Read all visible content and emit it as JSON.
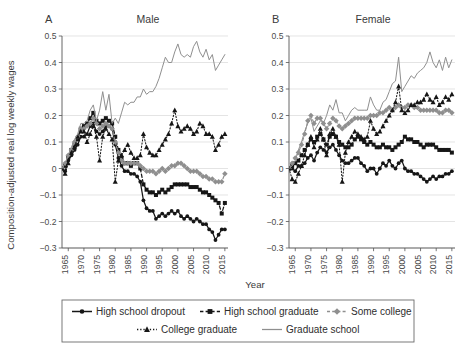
{
  "figure": {
    "ylabel": "Composition-adjusted real log weekly wages",
    "xlabel": "Year",
    "panels": [
      {
        "letter": "A",
        "title": "Male"
      },
      {
        "letter": "B",
        "title": "Female"
      }
    ],
    "legend": {
      "items": [
        {
          "label": "High school dropout",
          "style": "solid",
          "marker": "circle",
          "color": "#1a1a1a"
        },
        {
          "label": "High school graduate",
          "style": "dashed",
          "marker": "square",
          "color": "#1a1a1a"
        },
        {
          "label": "Some college",
          "style": "dashed",
          "marker": "diamond",
          "color": "#8c8c8c"
        },
        {
          "label": "College graduate",
          "style": "dotted",
          "marker": "triangle",
          "color": "#1a1a1a"
        },
        {
          "label": "Graduate school",
          "style": "solid",
          "marker": "none",
          "color": "#8c8c8c"
        }
      ]
    }
  },
  "chart_data": [
    {
      "type": "line",
      "title": "Male",
      "panel": "A",
      "xlabel": "Year",
      "ylabel": "Composition-adjusted real log weekly wages",
      "xlim": [
        1963,
        2016
      ],
      "ylim": [
        -0.3,
        0.5
      ],
      "yticks": [
        -0.3,
        -0.2,
        -0.1,
        0,
        0.1,
        0.2,
        0.3,
        0.4,
        0.5
      ],
      "ytick_labels": [
        "−0.3",
        "−0.2",
        "−0.1",
        "0",
        "0.1",
        "0.2",
        "0.3",
        "0.4",
        "0.5"
      ],
      "xticks": [
        1965,
        1970,
        1975,
        1980,
        1985,
        1990,
        1995,
        2000,
        2005,
        2010,
        2015
      ],
      "xtick_labels": [
        "1965",
        "1970",
        "1975",
        "1980",
        "1985",
        "1990",
        "1995",
        "2000",
        "2005",
        "2010",
        "2015"
      ],
      "grid": true,
      "legend_position": "bottom",
      "x": [
        1963,
        1964,
        1965,
        1966,
        1967,
        1968,
        1969,
        1970,
        1971,
        1972,
        1973,
        1974,
        1975,
        1976,
        1977,
        1978,
        1979,
        1980,
        1981,
        1982,
        1983,
        1984,
        1985,
        1986,
        1987,
        1988,
        1989,
        1990,
        1991,
        1992,
        1993,
        1994,
        1995,
        1996,
        1997,
        1998,
        1999,
        2000,
        2001,
        2002,
        2003,
        2004,
        2005,
        2006,
        2007,
        2008,
        2009,
        2010,
        2011,
        2012,
        2013,
        2014,
        2015
      ],
      "series": [
        {
          "name": "High school dropout",
          "values": [
            0.0,
            -0.01,
            0.03,
            0.05,
            0.07,
            0.09,
            0.12,
            0.12,
            0.13,
            0.16,
            0.17,
            0.14,
            0.13,
            0.14,
            0.16,
            0.16,
            0.15,
            0.09,
            0.04,
            0.01,
            -0.01,
            -0.01,
            -0.02,
            -0.02,
            -0.03,
            -0.05,
            -0.12,
            -0.15,
            -0.16,
            -0.16,
            -0.19,
            -0.18,
            -0.17,
            -0.18,
            -0.17,
            -0.16,
            -0.17,
            -0.16,
            -0.18,
            -0.19,
            -0.18,
            -0.19,
            -0.2,
            -0.19,
            -0.2,
            -0.21,
            -0.21,
            -0.23,
            -0.24,
            -0.27,
            -0.25,
            -0.23,
            -0.23
          ]
        },
        {
          "name": "High school graduate",
          "values": [
            0.0,
            0.01,
            0.04,
            0.07,
            0.09,
            0.11,
            0.15,
            0.16,
            0.17,
            0.19,
            0.21,
            0.18,
            0.17,
            0.18,
            0.19,
            0.18,
            0.17,
            0.12,
            0.07,
            0.04,
            0.02,
            0.02,
            0.01,
            0.02,
            0.02,
            0.0,
            -0.06,
            -0.08,
            -0.09,
            -0.09,
            -0.1,
            -0.09,
            -0.08,
            -0.09,
            -0.08,
            -0.07,
            -0.06,
            -0.06,
            -0.06,
            -0.06,
            -0.06,
            -0.07,
            -0.07,
            -0.07,
            -0.08,
            -0.09,
            -0.09,
            -0.1,
            -0.11,
            -0.12,
            -0.13,
            -0.17,
            -0.13
          ]
        },
        {
          "name": "Some college",
          "values": [
            0.0,
            0.02,
            0.05,
            0.07,
            0.1,
            0.12,
            0.15,
            0.15,
            0.16,
            0.17,
            0.19,
            0.17,
            0.15,
            0.16,
            0.17,
            0.16,
            0.15,
            0.1,
            0.06,
            0.03,
            0.02,
            0.02,
            0.02,
            0.02,
            0.02,
            0.01,
            0.0,
            -0.01,
            -0.01,
            -0.01,
            -0.02,
            -0.01,
            0.0,
            -0.01,
            0.0,
            0.01,
            0.01,
            0.02,
            0.02,
            0.01,
            0.0,
            -0.01,
            -0.01,
            -0.01,
            -0.02,
            -0.03,
            -0.03,
            -0.04,
            -0.04,
            -0.05,
            -0.05,
            -0.05,
            -0.02
          ]
        },
        {
          "name": "College graduate",
          "values": [
            0.0,
            -0.02,
            0.02,
            0.06,
            0.08,
            0.12,
            0.14,
            0.14,
            0.1,
            0.13,
            0.16,
            0.12,
            0.03,
            0.12,
            0.15,
            0.13,
            0.11,
            -0.05,
            0.03,
            0.05,
            0.07,
            0.09,
            0.06,
            0.04,
            0.04,
            0.05,
            0.13,
            0.08,
            0.06,
            0.05,
            0.05,
            0.07,
            0.09,
            0.11,
            0.13,
            0.17,
            0.22,
            0.16,
            0.14,
            0.15,
            0.16,
            0.15,
            0.13,
            0.14,
            0.17,
            0.16,
            0.13,
            0.13,
            0.12,
            0.07,
            0.09,
            0.12,
            0.13
          ]
        },
        {
          "name": "Graduate school",
          "values": [
            0.0,
            0.02,
            0.05,
            0.08,
            0.11,
            0.13,
            0.17,
            0.17,
            0.18,
            0.22,
            0.24,
            0.18,
            0.22,
            0.29,
            0.22,
            0.28,
            0.17,
            0.19,
            0.17,
            0.21,
            0.25,
            0.24,
            0.25,
            0.25,
            0.27,
            0.27,
            0.3,
            0.28,
            0.29,
            0.29,
            0.31,
            0.34,
            0.38,
            0.42,
            0.4,
            0.4,
            0.44,
            0.47,
            0.43,
            0.42,
            0.43,
            0.42,
            0.46,
            0.48,
            0.44,
            0.42,
            0.45,
            0.41,
            0.43,
            0.37,
            0.39,
            0.41,
            0.43
          ]
        }
      ]
    },
    {
      "type": "line",
      "title": "Female",
      "panel": "B",
      "xlabel": "Year",
      "ylabel": "Composition-adjusted real log weekly wages",
      "xlim": [
        1963,
        2016
      ],
      "ylim": [
        -0.3,
        0.5
      ],
      "yticks": [
        -0.3,
        -0.2,
        -0.1,
        0,
        0.1,
        0.2,
        0.3,
        0.4,
        0.5
      ],
      "ytick_labels": [
        "−0.3",
        "−0.2",
        "−0.1",
        "0",
        "0.1",
        "0.2",
        "0.3",
        "0.4",
        "0.5"
      ],
      "xticks": [
        1965,
        1970,
        1975,
        1980,
        1985,
        1990,
        1995,
        2000,
        2005,
        2010,
        2015
      ],
      "xtick_labels": [
        "1965",
        "1970",
        "1975",
        "1980",
        "1985",
        "1990",
        "1995",
        "2000",
        "2005",
        "2010",
        "2015"
      ],
      "grid": true,
      "legend_position": "bottom",
      "x": [
        1963,
        1964,
        1965,
        1966,
        1967,
        1968,
        1969,
        1970,
        1971,
        1972,
        1973,
        1974,
        1975,
        1976,
        1977,
        1978,
        1979,
        1980,
        1981,
        1982,
        1983,
        1984,
        1985,
        1986,
        1987,
        1988,
        1989,
        1990,
        1991,
        1992,
        1993,
        1994,
        1995,
        1996,
        1997,
        1998,
        1999,
        2000,
        2001,
        2002,
        2003,
        2004,
        2005,
        2006,
        2007,
        2008,
        2009,
        2010,
        2011,
        2012,
        2013,
        2014,
        2015
      ],
      "series": [
        {
          "name": "High school dropout",
          "values": [
            0.0,
            0.0,
            -0.01,
            0.01,
            0.01,
            0.02,
            0.04,
            0.05,
            0.03,
            0.06,
            0.08,
            0.07,
            0.06,
            0.08,
            0.09,
            0.07,
            0.05,
            0.03,
            0.02,
            0.02,
            0.03,
            0.04,
            0.04,
            0.02,
            0.01,
            -0.01,
            0.0,
            0.0,
            -0.02,
            0.0,
            0.02,
            0.01,
            0.03,
            0.01,
            0.0,
            0.02,
            0.03,
            0.0,
            -0.01,
            -0.01,
            -0.02,
            -0.02,
            -0.03,
            -0.04,
            -0.05,
            -0.04,
            -0.03,
            -0.04,
            -0.03,
            -0.03,
            -0.02,
            -0.02,
            -0.01
          ]
        },
        {
          "name": "High school graduate",
          "values": [
            0.0,
            0.01,
            0.02,
            0.03,
            0.05,
            0.07,
            0.09,
            0.11,
            0.1,
            0.12,
            0.13,
            0.11,
            0.09,
            0.12,
            0.13,
            0.12,
            0.1,
            0.09,
            0.08,
            0.08,
            0.09,
            0.11,
            0.12,
            0.11,
            0.1,
            0.09,
            0.1,
            0.09,
            0.08,
            0.08,
            0.09,
            0.08,
            0.08,
            0.07,
            0.08,
            0.09,
            0.1,
            0.12,
            0.11,
            0.11,
            0.1,
            0.1,
            0.09,
            0.08,
            0.09,
            0.09,
            0.09,
            0.08,
            0.07,
            0.07,
            0.07,
            0.07,
            0.06
          ]
        },
        {
          "name": "Some college",
          "values": [
            0.0,
            0.02,
            0.04,
            0.06,
            0.09,
            0.13,
            0.18,
            0.2,
            0.17,
            0.19,
            0.19,
            0.17,
            0.15,
            0.17,
            0.19,
            0.18,
            0.16,
            0.15,
            0.16,
            0.17,
            0.18,
            0.19,
            0.19,
            0.19,
            0.19,
            0.19,
            0.2,
            0.2,
            0.2,
            0.21,
            0.21,
            0.22,
            0.23,
            0.22,
            0.23,
            0.24,
            0.23,
            0.23,
            0.24,
            0.24,
            0.23,
            0.23,
            0.22,
            0.22,
            0.22,
            0.22,
            0.22,
            0.22,
            0.21,
            0.21,
            0.22,
            0.22,
            0.21
          ]
        },
        {
          "name": "College graduate",
          "values": [
            0.0,
            -0.04,
            -0.05,
            -0.02,
            0.01,
            0.05,
            0.09,
            0.12,
            0.08,
            0.11,
            0.15,
            0.11,
            0.05,
            0.13,
            0.15,
            0.12,
            0.09,
            -0.05,
            0.06,
            0.1,
            0.12,
            0.14,
            0.13,
            0.12,
            0.11,
            0.12,
            0.18,
            0.15,
            0.13,
            0.14,
            0.16,
            0.18,
            0.2,
            0.22,
            0.25,
            0.31,
            0.22,
            0.21,
            0.22,
            0.24,
            0.24,
            0.25,
            0.25,
            0.26,
            0.28,
            0.26,
            0.25,
            0.27,
            0.24,
            0.25,
            0.27,
            0.26,
            0.28
          ]
        },
        {
          "name": "Graduate school",
          "values": [
            0.0,
            0.01,
            0.03,
            0.07,
            0.1,
            0.14,
            0.17,
            0.19,
            0.14,
            0.16,
            0.18,
            0.17,
            0.2,
            0.24,
            0.22,
            0.26,
            0.21,
            0.21,
            0.18,
            0.2,
            0.22,
            0.23,
            0.22,
            0.22,
            0.22,
            0.22,
            0.27,
            0.24,
            0.22,
            0.22,
            0.25,
            0.26,
            0.29,
            0.32,
            0.33,
            0.42,
            0.29,
            0.31,
            0.33,
            0.35,
            0.34,
            0.36,
            0.37,
            0.38,
            0.4,
            0.44,
            0.4,
            0.38,
            0.41,
            0.37,
            0.42,
            0.38,
            0.41
          ]
        }
      ]
    }
  ]
}
